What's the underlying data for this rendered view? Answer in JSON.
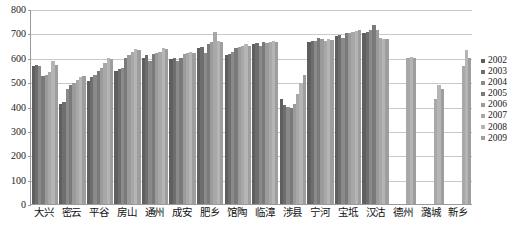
{
  "chart_data": {
    "type": "bar",
    "title": "",
    "xlabel": "",
    "ylabel": "",
    "ylim": [
      0,
      800
    ],
    "yticks": [
      0,
      100,
      200,
      300,
      400,
      500,
      600,
      700,
      800
    ],
    "grid": true,
    "legend_position": "right",
    "categories": [
      "大兴",
      "密云",
      "平谷",
      "房山",
      "通州",
      "成安",
      "肥乡",
      "馆陶",
      "临漳",
      "涉县",
      "宁河",
      "宝坻",
      "汉沽",
      "德州",
      "潞城",
      "新乡"
    ],
    "series": [
      {
        "name": "2002",
        "color": "#5f5f5f",
        "values": [
          565,
          410,
          505,
          545,
          600,
          595,
          640,
          610,
          655,
          430,
          665,
          690,
          700,
          null,
          null,
          null
        ]
      },
      {
        "name": "2003",
        "color": "#6e6e6e",
        "values": [
          570,
          420,
          520,
          555,
          610,
          600,
          645,
          615,
          660,
          405,
          670,
          695,
          705,
          null,
          null,
          null
        ]
      },
      {
        "name": "2004",
        "color": "#8a8a8a",
        "values": [
          565,
          470,
          530,
          560,
          585,
          585,
          620,
          625,
          650,
          400,
          670,
          680,
          715,
          null,
          null,
          null
        ]
      },
      {
        "name": "2005",
        "color": "#7a7a7a",
        "values": [
          525,
          490,
          545,
          600,
          615,
          600,
          655,
          640,
          665,
          395,
          680,
          700,
          735,
          null,
          null,
          null
        ]
      },
      {
        "name": "2006",
        "color": "#9b9b9b",
        "values": [
          530,
          495,
          560,
          610,
          620,
          615,
          665,
          645,
          660,
          410,
          675,
          700,
          715,
          null,
          null,
          null
        ]
      },
      {
        "name": "2007",
        "color": "#a8a8a8",
        "values": [
          540,
          510,
          580,
          625,
          625,
          620,
          705,
          650,
          665,
          450,
          670,
          705,
          680,
          600,
          430,
          565
        ]
      },
      {
        "name": "2008",
        "color": "#b5b5b5",
        "values": [
          585,
          520,
          600,
          635,
          640,
          625,
          670,
          655,
          670,
          495,
          675,
          710,
          675,
          605,
          490,
          630
        ]
      },
      {
        "name": "2009",
        "color": "#9e9e9e",
        "values": [
          570,
          525,
          595,
          630,
          635,
          620,
          665,
          650,
          665,
          530,
          672,
          715,
          678,
          598,
          470,
          600
        ]
      }
    ]
  },
  "legend": {
    "items": [
      {
        "label": "2002"
      },
      {
        "label": "2003"
      },
      {
        "label": "2004"
      },
      {
        "label": "2005"
      },
      {
        "label": "2006"
      },
      {
        "label": "2007"
      },
      {
        "label": "2008"
      },
      {
        "label": "2009"
      }
    ]
  },
  "axis": {
    "y_labels": [
      "800",
      "700",
      "600",
      "500",
      "400",
      "300",
      "200",
      "100",
      "0"
    ]
  }
}
